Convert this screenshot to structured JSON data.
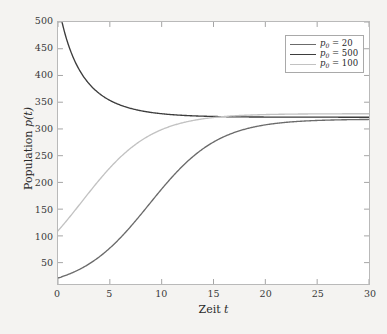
{
  "chart_data": {
    "type": "line",
    "title": "",
    "xlabel": "Zeit t",
    "ylabel": "Population p(t)",
    "xlim": [
      0,
      30
    ],
    "ylim": [
      10,
      500
    ],
    "grid": false,
    "legend_position": "top-right",
    "xticks": [
      0,
      5,
      10,
      15,
      20,
      25,
      30
    ],
    "yticks": [
      50,
      100,
      150,
      200,
      250,
      300,
      350,
      400,
      450,
      500
    ],
    "carrying_capacity": 300,
    "growth_rate": 0.3,
    "series": [
      {
        "name": "p0 = 20",
        "p0": 20,
        "color": "#6b6b6b",
        "x": [
          0,
          1,
          2,
          3,
          4,
          5,
          6,
          7,
          8,
          9,
          10,
          11,
          12,
          13,
          14,
          15,
          16,
          17,
          18,
          19,
          20,
          21,
          22,
          23,
          24,
          25,
          26,
          27,
          28,
          29,
          30
        ],
        "values": [
          20,
          26.4,
          34.6,
          45.1,
          58.3,
          74.6,
          94.4,
          117.7,
          144.3,
          173.3,
          203.1,
          231.7,
          256.9,
          277.2,
          292.1,
          302.3,
          308.8,
          312.8,
          315.1,
          316.5,
          317.3,
          317.7,
          318.0,
          318.1,
          318.2,
          318.2,
          318.3,
          318.3,
          318.3,
          318.3,
          318.3
        ]
      },
      {
        "name": "p0 = 500",
        "p0": 500,
        "color": "#3d3d3d",
        "x": [
          0,
          1,
          2,
          3,
          4,
          5,
          6,
          7,
          8,
          9,
          10,
          11,
          12,
          13,
          14,
          15,
          16,
          17,
          18,
          19,
          20,
          21,
          22,
          23,
          24,
          25,
          26,
          27,
          28,
          29,
          30
        ],
        "values": [
          500,
          446.9,
          409.6,
          383.4,
          365.0,
          352.1,
          343.1,
          336.7,
          332.3,
          329.2,
          327.0,
          325.4,
          324.4,
          323.6,
          323.1,
          322.7,
          322.4,
          322.2,
          322.1,
          322.0,
          322.0,
          321.9,
          321.9,
          321.9,
          321.9,
          321.9,
          321.9,
          321.9,
          321.9,
          321.9,
          321.9
        ]
      },
      {
        "name": "p0 = 100",
        "p0": 100,
        "color": "#c2c2c2",
        "x": [
          0,
          1,
          2,
          3,
          4,
          5,
          6,
          7,
          8,
          9,
          10,
          11,
          12,
          13,
          14,
          15,
          16,
          17,
          18,
          19,
          20,
          21,
          22,
          23,
          24,
          25,
          26,
          27,
          28,
          29,
          30
        ],
        "values": [
          100,
          124.6,
          151.8,
          180.4,
          208.8,
          235.3,
          258.6,
          277.9,
          292.9,
          304.1,
          312.1,
          317.6,
          321.4,
          323.9,
          325.5,
          326.6,
          327.3,
          327.7,
          328.0,
          328.2,
          328.3,
          328.4,
          328.4,
          328.4,
          328.5,
          328.5,
          328.5,
          328.5,
          328.5,
          328.5,
          328.5
        ]
      }
    ],
    "legend": [
      {
        "label_prefix": "p",
        "label_sub": "0",
        "label_eq": "=",
        "label_value": "20",
        "color": "#6b6b6b"
      },
      {
        "label_prefix": "p",
        "label_sub": "0",
        "label_eq": "=",
        "label_value": "500",
        "color": "#3d3d3d"
      },
      {
        "label_prefix": "p",
        "label_sub": "0",
        "label_eq": "=",
        "label_value": "100",
        "color": "#c2c2c2"
      }
    ]
  },
  "axes": {
    "x_title_text": "Zeit",
    "x_title_var": "t",
    "y_title_text": "Population",
    "y_title_var": "p",
    "y_title_arg": "(t)",
    "xtick_labels": [
      "0",
      "5",
      "10",
      "15",
      "20",
      "25",
      "30"
    ],
    "ytick_labels": [
      "50",
      "100",
      "150",
      "200",
      "250",
      "300",
      "350",
      "400",
      "450",
      "500"
    ]
  },
  "colors": {
    "figure_background": "#f4f3f1",
    "plot_background": "#ffffff",
    "axis": "#b9b9b9",
    "tick": "#9a9a9a",
    "text": "#2a2a2a"
  }
}
